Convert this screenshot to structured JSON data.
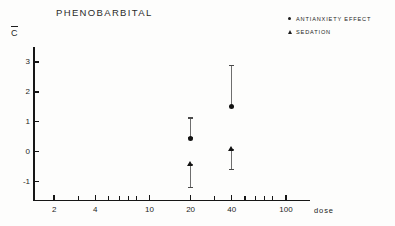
{
  "chart_data": {
    "type": "scatter",
    "title": "PHENOBARBITAL",
    "xlabel": "dose",
    "ylabel": "C̅",
    "xscale": "log",
    "xlim": [
      1.4,
      150
    ],
    "ylim": [
      -1.6,
      3.5
    ],
    "grid": false,
    "legend_position": "top-right",
    "xtick_labels": [
      "2",
      "4",
      "10",
      "20",
      "40",
      "100"
    ],
    "xtick_values": [
      2,
      4,
      10,
      20,
      40,
      100
    ],
    "xtick_minor_values": [
      3,
      5,
      6,
      7,
      8,
      30,
      50,
      60,
      70,
      80
    ],
    "ytick_labels": [
      "3",
      "2",
      "1",
      "0",
      "-1"
    ],
    "ytick_values": [
      3,
      2,
      1,
      0,
      -1
    ],
    "series": [
      {
        "name": "ANTIANXIETY EFFECT",
        "marker": "circle",
        "points": [
          {
            "x": 20,
            "y": 0.45,
            "err_low": 0.45,
            "err_high": 1.15
          },
          {
            "x": 40,
            "y": 1.5,
            "err_low": 1.5,
            "err_high": 2.9
          }
        ]
      },
      {
        "name": "SEDATION",
        "marker": "triangle",
        "points": [
          {
            "x": 20,
            "y": -0.4,
            "err_low": -1.2,
            "err_high": -0.4
          },
          {
            "x": 40,
            "y": 0.1,
            "err_low": -0.6,
            "err_high": 0.1
          }
        ]
      }
    ]
  },
  "legend": {
    "items": [
      {
        "label": "ANTIANXIETY EFFECT",
        "marker": "circle"
      },
      {
        "label": "SEDATION",
        "marker": "triangle"
      }
    ]
  }
}
